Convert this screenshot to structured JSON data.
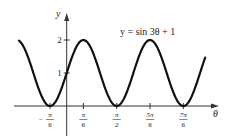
{
  "chart_data": {
    "type": "line",
    "title": "y = sin 3θ + 1",
    "equation_label": "y =  sin 3θ + 1",
    "xlabel": "θ",
    "ylabel": "y",
    "x_ticks": [
      {
        "value": -0.5236,
        "num": "π",
        "den": "6",
        "sign": "−"
      },
      {
        "value": 0.5236,
        "num": "π",
        "den": "6",
        "sign": ""
      },
      {
        "value": 1.5708,
        "num": "π",
        "den": "2",
        "sign": ""
      },
      {
        "value": 2.618,
        "num": "5π",
        "den": "6",
        "sign": ""
      },
      {
        "value": 3.6652,
        "num": "7π",
        "den": "6",
        "sign": ""
      }
    ],
    "y_ticks": [
      {
        "value": 1,
        "label": "1"
      },
      {
        "value": 2,
        "label": "2"
      }
    ],
    "xlim": [
      -1.5,
      4.4
    ],
    "ylim": [
      0,
      2
    ],
    "series": [
      {
        "name": "sin 3θ + 1",
        "function": "sin(3*theta)+1",
        "domain": [
          -1.5,
          4.35
        ],
        "color": "#111111"
      }
    ],
    "grid": false,
    "legend": "none"
  }
}
